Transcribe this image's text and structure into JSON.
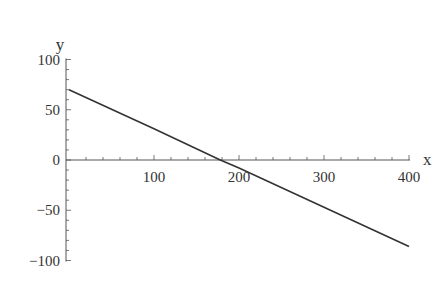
{
  "chart_data": {
    "type": "line",
    "title": "",
    "xlabel": "x",
    "ylabel": "y",
    "xlim": [
      0,
      400
    ],
    "ylim": [
      -100,
      100
    ],
    "grid": false,
    "legend": null,
    "x_ticks": [
      100,
      200,
      300,
      400
    ],
    "y_ticks": [
      -100,
      -50,
      0,
      50,
      100
    ],
    "x_tick_labels": [
      "100",
      "200",
      "300",
      "400"
    ],
    "y_tick_labels": [
      "−100",
      "−50",
      "0",
      "50",
      "100"
    ],
    "series": [
      {
        "name": "y = 70 - 0.39x",
        "x": [
          0,
          100,
          178,
          200,
          300,
          400
        ],
        "values": [
          70,
          31,
          0,
          -8,
          -47,
          -86
        ],
        "color": "#333333"
      }
    ]
  },
  "colors": {
    "axis": "#555555",
    "line": "#333333",
    "background": "#ffffff"
  }
}
